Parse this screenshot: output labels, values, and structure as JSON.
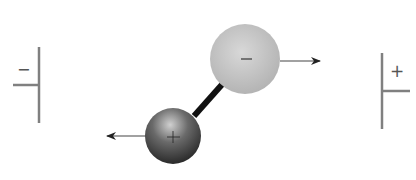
{
  "diagram": {
    "left_plate": {
      "sign": "−",
      "color": "#808080"
    },
    "right_plate": {
      "sign": "+",
      "color": "#808080"
    },
    "negative_sphere": {
      "sign": "−",
      "fill": "#c4c4c4",
      "force_direction": "right"
    },
    "positive_sphere": {
      "sign": "+",
      "fill": "#4a4a4a",
      "force_direction": "left"
    },
    "bond_color": "#111111",
    "arrow_color": "#222222"
  }
}
